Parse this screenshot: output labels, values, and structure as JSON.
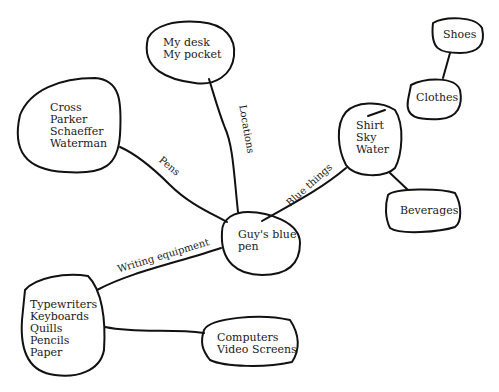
{
  "diagram": {
    "type": "mind-map",
    "central_node": {
      "id": "center",
      "label": "Guy's blue\npen"
    },
    "nodes": [
      {
        "id": "center",
        "label": "Guy's blue\npen"
      },
      {
        "id": "locations",
        "label": "My desk\nMy pocket"
      },
      {
        "id": "pens",
        "label": "Cross\nParker\nSchaeffer\nWaterman"
      },
      {
        "id": "blue",
        "label": "Shirt\nSky\nWater"
      },
      {
        "id": "clothes",
        "label": "Clothes"
      },
      {
        "id": "shoes",
        "label": "Shoes"
      },
      {
        "id": "beverages",
        "label": "Beverages"
      },
      {
        "id": "writing",
        "label": "Typewriters\nKeyboards\nQuills\nPencils\nPaper"
      },
      {
        "id": "computers",
        "label": "Computers\nVideo Screens"
      }
    ],
    "edges": [
      {
        "from": "center",
        "to": "locations",
        "label": "Locations"
      },
      {
        "from": "center",
        "to": "pens",
        "label": "Pens"
      },
      {
        "from": "center",
        "to": "blue",
        "label": "Blue things"
      },
      {
        "from": "center",
        "to": "writing",
        "label": "Writing equipment"
      },
      {
        "from": "blue",
        "to": "clothes",
        "label": ""
      },
      {
        "from": "clothes",
        "to": "shoes",
        "label": ""
      },
      {
        "from": "blue",
        "to": "beverages",
        "label": ""
      },
      {
        "from": "writing",
        "to": "computers",
        "label": ""
      }
    ]
  },
  "labels": {
    "center": "Guy's blue\npen",
    "locations": "My desk\nMy pocket",
    "pens": "Cross\nParker\nSchaeffer\nWaterman",
    "blue": "Shirt\nSky\nWater",
    "clothes": "Clothes",
    "shoes": "Shoes",
    "beverages": "Beverages",
    "writing": "Typewriters\nKeyboards\nQuills\nPencils\nPaper",
    "computers": "Computers\nVideo Screens",
    "edge_locations": "Locations",
    "edge_pens": "Pens",
    "edge_blue": "Blue things",
    "edge_writing": "Writing equipment"
  }
}
